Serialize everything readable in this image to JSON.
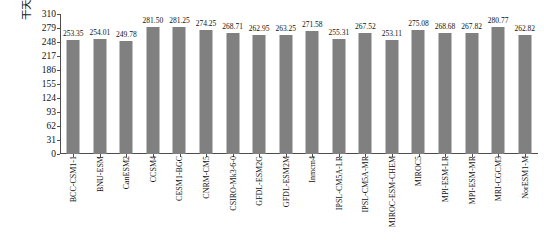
{
  "chart_data": {
    "type": "bar",
    "title": "",
    "xlabel": "",
    "ylabel": "干天天数 (d)",
    "ylim": [
      0,
      310
    ],
    "yticks": [
      0,
      31,
      62,
      93,
      124,
      155,
      186,
      217,
      248,
      279,
      310
    ],
    "grid": false,
    "legend": "none",
    "bar_color": "#808080",
    "categories": [
      "BCC-CSM1-1",
      "BNU-ESM",
      "CanESM2",
      "CCSM4",
      "CESM1-BGC",
      "CNRM-CM5",
      "CSIRO-Mk3-6-0",
      "GFDL-ESM2G",
      "GFDL-ESM2M",
      "Inmcm4",
      "IPSL-CM5A-LR",
      "IPSL-CM5A-MR",
      "MIROC-ESM-CHEM",
      "MIROC5",
      "MPI-ESM-LR",
      "MPI-ESM-MR",
      "MRI-CGCM3",
      "NorESM1-M"
    ],
    "values": [
      253.35,
      254.01,
      249.78,
      281.5,
      281.25,
      274.25,
      268.71,
      262.95,
      263.25,
      271.58,
      255.31,
      267.52,
      253.11,
      275.08,
      268.68,
      267.82,
      280.77,
      262.82
    ],
    "value_labels": [
      "253.35",
      "254.01",
      "249.78",
      "281.50",
      "281.25",
      "274.25",
      "268.71",
      "262.95",
      "263.25",
      "271.58",
      "255.31",
      "267.52",
      "253.11",
      "275.08",
      "268.68",
      "267.82",
      "280.77",
      "262.82"
    ]
  }
}
